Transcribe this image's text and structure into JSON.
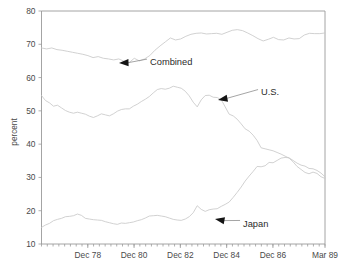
{
  "chart_data": {
    "type": "line",
    "title": "",
    "xlabel": "",
    "ylabel": "percent",
    "ylim": [
      10,
      80
    ],
    "yticks": [
      10,
      20,
      30,
      40,
      50,
      60,
      70,
      80
    ],
    "ytick_labels": [
      "10",
      "20",
      "30",
      "40",
      "50",
      "60",
      "70",
      "80"
    ],
    "grid": false,
    "legend": "inline-annotations",
    "xlim_labels": [
      "Dec 78",
      "Dec 80",
      "Dec 82",
      "Dec 84",
      "Dec 86",
      "Mar 89"
    ],
    "xtick_labels": [
      "Dec 78",
      "Dec 80",
      "Dec 82",
      "Dec 84",
      "Dec 86",
      "Mar 89"
    ],
    "xtick_positions": [
      8,
      16,
      24,
      32,
      40,
      49
    ],
    "x_index_range": [
      0,
      49
    ],
    "x_tick_interval_note": "quarterly minor ticks",
    "annotations": [
      {
        "name": "Combined",
        "label": "Combined",
        "label_x": 150,
        "label_y": 62,
        "arrow_tip_x": 119,
        "arrow_tip_y": 63
      },
      {
        "name": "U.S.",
        "label": "U.S.",
        "label_x": 261,
        "label_y": 92,
        "arrow_tip_x": 218,
        "arrow_tip_y": 100
      },
      {
        "name": "Japan",
        "label": "Japan",
        "label_x": 243,
        "label_y": 224,
        "arrow_tip_x": 215,
        "arrow_tip_y": 219
      }
    ],
    "series": [
      {
        "name": "Combined",
        "color": "#c9c9c9",
        "values": [
          68.9,
          68.6,
          68.9,
          68.4,
          68.2,
          67.9,
          67.6,
          67.3,
          67.0,
          66.6,
          66.0,
          66.3,
          65.8,
          65.6,
          65.3,
          65.6,
          64.9,
          64.5,
          65.8,
          65.0,
          65.6,
          66.6,
          68.2,
          69.5,
          70.7,
          71.9,
          71.3,
          71.6,
          72.4,
          73.0,
          73.3,
          73.4,
          73.1,
          73.2,
          73.3,
          73.0,
          73.6,
          74.2,
          74.4,
          74.1,
          73.4,
          72.6,
          71.7,
          71.0,
          71.5,
          72.1,
          71.4,
          71.3,
          71.9,
          71.6,
          71.7,
          72.8,
          73.3,
          73.2,
          73.2,
          73.4
        ]
      },
      {
        "name": "U.S.",
        "color": "#c9c9c9",
        "values": [
          54.6,
          53.1,
          52.4,
          51.4,
          51.7,
          50.9,
          50.1,
          49.6,
          49.3,
          49.6,
          49.3,
          49.0,
          48.4,
          48.0,
          48.5,
          49.1,
          48.8,
          48.5,
          49.1,
          49.9,
          50.4,
          50.6,
          50.6,
          51.4,
          52.0,
          52.8,
          53.5,
          54.3,
          55.4,
          56.4,
          56.7,
          56.5,
          56.8,
          57.4,
          57.1,
          56.8,
          55.9,
          54.5,
          52.6,
          51.2,
          53.3,
          54.6,
          54.7,
          54.1,
          54.0,
          53.4,
          51.2,
          49.0,
          48.5,
          47.5,
          46.1,
          44.6,
          43.9,
          42.7,
          41.1,
          38.9,
          38.6,
          38.3,
          38.0,
          37.5,
          37.0,
          36.4,
          35.8,
          34.7,
          33.3,
          32.4,
          31.5,
          31.1,
          31.6,
          31.2,
          30.2,
          29.7
        ]
      },
      {
        "name": "Japan",
        "color": "#c9c9c9",
        "values": [
          15.0,
          15.7,
          16.2,
          17.0,
          17.4,
          17.7,
          18.2,
          18.3,
          18.5,
          19.0,
          18.6,
          17.7,
          17.5,
          17.3,
          17.2,
          17.1,
          16.7,
          16.4,
          16.1,
          15.9,
          16.3,
          16.2,
          16.4,
          16.6,
          17.0,
          17.3,
          17.8,
          18.4,
          18.5,
          18.6,
          18.4,
          18.2,
          17.8,
          17.4,
          17.2,
          17.1,
          17.5,
          18.2,
          19.4,
          21.5,
          20.4,
          19.8,
          20.3,
          20.5,
          20.6,
          21.3,
          21.9,
          22.6,
          24.0,
          25.5,
          27.1,
          28.9,
          30.4,
          31.8,
          33.3,
          33.2,
          33.5,
          34.5,
          34.4,
          35.1,
          35.8,
          36.0,
          35.9,
          35.1,
          34.3,
          33.7,
          33.4,
          32.7,
          32.6,
          32.1,
          31.3,
          30.2
        ]
      }
    ]
  },
  "axis": {
    "y_title": "percent"
  }
}
